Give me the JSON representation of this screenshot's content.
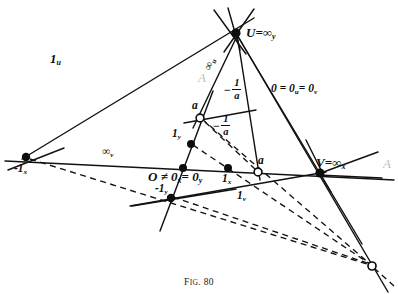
{
  "figure": {
    "caption_lead": "F",
    "caption_small": "IG",
    "caption_dot": ". ",
    "caption_number": "80",
    "caption_full": "Fig. 80",
    "background_color": "#ffffff",
    "ink_color": "#111111",
    "width": 398,
    "height": 294
  },
  "top_strip": {
    "text": "scanned page text cropped at top edge"
  },
  "ghost_marks": {
    "left_mark": "A",
    "right_mark": "A",
    "center_mark": "A"
  },
  "points": [
    {
      "id": "U",
      "label_html": "U<span class=\"eq\">=</span>∞<sub>y</sub>",
      "x": 236,
      "y": 33,
      "style": "filled",
      "label_dx": 10,
      "label_dy": -2
    },
    {
      "id": "V",
      "label_html": "V<span class=\"eq\">=</span>∞<sub>x</sub>",
      "x": 320,
      "y": 173,
      "style": "filled",
      "label_dx": -4,
      "label_dy": -13
    },
    {
      "id": "minus1x",
      "label_html": "-1<sub>x</sub>",
      "x": 26,
      "y": 157,
      "style": "filled",
      "label_dx": -10,
      "label_dy": 8
    },
    {
      "id": "O",
      "label_html": "O",
      "x": 183,
      "y": 168,
      "style": "filled",
      "label_dx": -30,
      "label_dy": 8
    },
    {
      "id": "1x",
      "label_html": "1<sub>x</sub>",
      "x": 228,
      "y": 168,
      "style": "filled",
      "label_dx": -5,
      "label_dy": 10
    },
    {
      "id": "1y",
      "label_html": "1<sub>y</sub>",
      "x": 191,
      "y": 144,
      "style": "filled",
      "label_dx": -17,
      "label_dy": -10
    },
    {
      "id": "minus1y",
      "label_html": "-1<sub>y</sub>",
      "x": 171,
      "y": 198,
      "style": "filled",
      "label_dx": -10,
      "label_dy": -10
    },
    {
      "id": "a_upper",
      "label_html": "a",
      "x": 200,
      "y": 118,
      "style": "open",
      "label_dx": -6,
      "label_dy": -14
    },
    {
      "id": "a_lower",
      "label_html": "a",
      "x": 258,
      "y": 172,
      "style": "open",
      "label_dx": 2,
      "label_dy": -14
    },
    {
      "id": "far_pt",
      "label_html": "",
      "x": 372,
      "y": 266,
      "style": "open",
      "label_dx": 0,
      "label_dy": 0
    }
  ],
  "labels": [
    {
      "id": "label-1u",
      "text_html": "1<sub>u</sub>",
      "x": 154,
      "y": 55,
      "size": "sz-big"
    },
    {
      "id": "label-inf-u",
      "text_html": "∞<sub>u</sub>",
      "x": 214,
      "y": 68,
      "size": "sz-med",
      "rotate": -72
    },
    {
      "id": "label-inf-v",
      "text_html": "∞<sub>v</sub>",
      "x": 108,
      "y": 148,
      "size": "sz-med"
    },
    {
      "id": "label-1v",
      "text_html": "1<sub>v</sub>",
      "x": 240,
      "y": 190,
      "size": "sz-med"
    },
    {
      "id": "label-zero-uv",
      "text_html": "0 <span class=\"up\">=</span> 0<sub>u</sub><span class=\"up\">=</span> 0<sub>v</sub>",
      "x": 277,
      "y": 89,
      "size": "sz-med"
    },
    {
      "id": "label-O-eq",
      "text_html": "O <span class=\"up\">≠</span> 0<sub>x&#x0304;</sub><span class=\"up\">=</span> 0<sub>y</sub>",
      "x": 150,
      "y": 172,
      "size": "sz-big"
    }
  ],
  "fractions": [
    {
      "id": "frac-upper",
      "minus": "−",
      "numerator": "1",
      "denominator": "a",
      "x": 226,
      "y": 82,
      "note": "-1/a label on line toward U"
    },
    {
      "id": "frac-lower",
      "minus": "−",
      "numerator": "1",
      "denominator": "a",
      "x": 216,
      "y": 118,
      "note": "-1/a label on dashed line from a"
    }
  ],
  "chart_data": {
    "type": "diagram",
    "title": "Fig. 80",
    "solid_lines": [
      {
        "name": "x-axis",
        "from": [
          5,
          161
        ],
        "to": [
          394,
          180
        ]
      },
      {
        "name": "line-1u-U",
        "from": [
          26,
          157
        ],
        "to": [
          252,
          19
        ]
      },
      {
        "name": "y-axis-scale",
        "from": [
          160,
          231
        ],
        "to": [
          212,
          93
        ]
      },
      {
        "name": "line-U-V",
        "from": [
          236,
          33
        ],
        "to": [
          330,
          190
        ]
      },
      {
        "name": "line-U-far",
        "from": [
          236,
          33
        ],
        "to": [
          386,
          289
        ]
      },
      {
        "name": "line-U-down-left",
        "from": [
          236,
          33
        ],
        "to": [
          196,
          125
        ]
      },
      {
        "name": "line-U-down-mid",
        "from": [
          236,
          33
        ],
        "to": [
          259,
          178
        ]
      },
      {
        "name": "line-U-stub-a",
        "from": [
          216,
          12
        ],
        "to": [
          244,
          52
        ]
      },
      {
        "name": "line-U-stub-b",
        "from": [
          252,
          10
        ],
        "to": [
          226,
          50
        ]
      },
      {
        "name": "line-V-left",
        "from": [
          320,
          173
        ],
        "to": [
          132,
          205
        ]
      },
      {
        "name": "line-V-right-up",
        "from": [
          320,
          173
        ],
        "to": [
          372,
          155
        ]
      },
      {
        "name": "line-V-down",
        "from": [
          320,
          173
        ],
        "to": [
          358,
          236
        ]
      },
      {
        "name": "line-a-upper-left",
        "from": [
          186,
          122
        ],
        "to": [
          252,
          111
        ]
      },
      {
        "name": "line-minus1x-dn",
        "from": [
          10,
          170
        ],
        "to": [
          60,
          150
        ]
      },
      {
        "name": "line-minus1y-lo",
        "from": [
          134,
          205
        ],
        "to": [
          228,
          190
        ]
      }
    ],
    "dashed_lines": [
      {
        "name": "dash-minus1x-far",
        "from": [
          30,
          160
        ],
        "to": [
          372,
          266
        ]
      },
      {
        "name": "dash-a-upper-far",
        "from": [
          200,
          118
        ],
        "to": [
          372,
          266
        ]
      },
      {
        "name": "dash-1y-far",
        "from": [
          191,
          144
        ],
        "to": [
          372,
          266
        ]
      },
      {
        "name": "dash-minus1y-far",
        "from": [
          171,
          198
        ],
        "to": [
          372,
          266
        ]
      },
      {
        "name": "dash-a-lower-out",
        "from": [
          258,
          172
        ],
        "to": [
          386,
          280
        ]
      }
    ]
  }
}
